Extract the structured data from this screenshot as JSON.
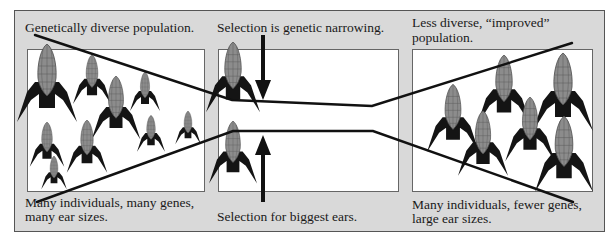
{
  "colors": {
    "frame_bg": "#d9d9d9",
    "frame_border": "#555555",
    "panel_bg": "#ffffff",
    "panel_border": "#666666",
    "leaf": "#141414",
    "ear": "#8c8c8c",
    "ear_grid": "#5a5a5a",
    "line": "#111111"
  },
  "left_panel": {
    "top_caption": "Genetically diverse population.",
    "bottom_caption_line1": "Many individuals, many genes,",
    "bottom_caption_line2": "many ear sizes."
  },
  "middle_panel": {
    "top_caption": "Selection is genetic narrowing.",
    "bottom_caption": "Selection for biggest ears."
  },
  "right_panel": {
    "top_caption_line1": "Less diverse, “improved”",
    "top_caption_line2": "population.",
    "bottom_caption_line1": "Many individuals, fewer genes,",
    "bottom_caption_line2": "large ear sizes."
  },
  "icons": {
    "plant": "corn-plant-icon",
    "arrow_down": "arrow-down-icon",
    "arrow_up": "arrow-up-icon"
  }
}
